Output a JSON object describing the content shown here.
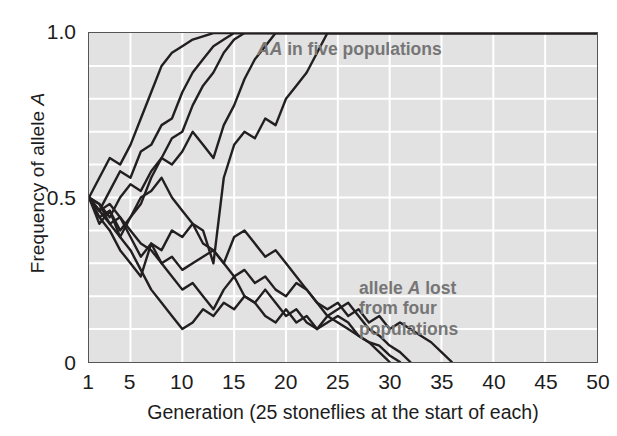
{
  "chart_data": {
    "type": "line",
    "title": "",
    "xlabel": "Generation (25 stoneflies at the start of each)",
    "ylabel": "Frequency of allele A",
    "xlim": [
      1,
      50
    ],
    "ylim": [
      0,
      1.0
    ],
    "xticks": [
      1,
      5,
      10,
      15,
      20,
      25,
      30,
      35,
      40,
      45,
      50
    ],
    "xticklabels": [
      "1",
      "5",
      "10",
      "15",
      "20",
      "25",
      "30",
      "35",
      "40",
      "45",
      "50"
    ],
    "yticks": [
      0,
      0.5,
      1.0
    ],
    "yticklabels": [
      "0",
      "0.5",
      "1.0"
    ],
    "grid": "both, white lines; vertical every 5 generations, horizontal every 0.1",
    "legend_position": "none (in-plot text annotations)",
    "plot_background": "#e2e2e2",
    "line_color": "#231f20",
    "annotation_color": "#767676",
    "annotations": [
      {
        "id": "fixed",
        "text": "AA in five populations",
        "italic_part": "AA",
        "rest": " in five populations",
        "x": 22,
        "y": 0.97
      },
      {
        "id": "lost",
        "text": "allele A lost\nfrom four\npopulations",
        "line1_pre": "allele ",
        "line1_italic": "A",
        "line1_post": " lost",
        "line2": "from four",
        "line3": "populations",
        "x": 36,
        "y": 0.25
      }
    ],
    "series": [
      {
        "name": "population 1 (A fixed)",
        "outcome": "fixed",
        "x": [
          1,
          2,
          3,
          4,
          5,
          6,
          7,
          8,
          9,
          10,
          11,
          12,
          13,
          50
        ],
        "values": [
          0.5,
          0.56,
          0.62,
          0.6,
          0.66,
          0.74,
          0.82,
          0.9,
          0.94,
          0.96,
          0.98,
          0.99,
          1.0,
          1.0
        ]
      },
      {
        "name": "population 2 (A fixed)",
        "outcome": "fixed",
        "x": [
          1,
          2,
          3,
          4,
          5,
          6,
          7,
          8,
          9,
          10,
          11,
          12,
          13,
          14,
          15,
          50
        ],
        "values": [
          0.5,
          0.46,
          0.52,
          0.58,
          0.56,
          0.64,
          0.66,
          0.72,
          0.74,
          0.82,
          0.88,
          0.92,
          0.96,
          0.98,
          1.0,
          1.0
        ]
      },
      {
        "name": "population 3 (A fixed)",
        "outcome": "fixed",
        "x": [
          1,
          2,
          3,
          4,
          5,
          6,
          7,
          8,
          9,
          10,
          11,
          12,
          13,
          14,
          15,
          16,
          50
        ],
        "values": [
          0.5,
          0.48,
          0.44,
          0.5,
          0.54,
          0.52,
          0.58,
          0.62,
          0.68,
          0.7,
          0.78,
          0.84,
          0.88,
          0.94,
          0.98,
          1.0,
          1.0
        ]
      },
      {
        "name": "population 4 (A fixed)",
        "outcome": "fixed",
        "x": [
          1,
          2,
          3,
          4,
          5,
          6,
          7,
          8,
          9,
          10,
          11,
          12,
          13,
          14,
          15,
          16,
          17,
          18,
          19,
          50
        ],
        "values": [
          0.5,
          0.44,
          0.46,
          0.4,
          0.44,
          0.48,
          0.56,
          0.62,
          0.6,
          0.64,
          0.7,
          0.66,
          0.62,
          0.72,
          0.78,
          0.86,
          0.92,
          0.96,
          1.0,
          1.0
        ]
      },
      {
        "name": "population 5 (A fixed)",
        "outcome": "fixed",
        "x": [
          1,
          2,
          3,
          4,
          5,
          6,
          7,
          8,
          9,
          10,
          11,
          12,
          13,
          14,
          15,
          16,
          17,
          18,
          19,
          20,
          21,
          22,
          23,
          24,
          50
        ],
        "values": [
          0.5,
          0.46,
          0.42,
          0.38,
          0.44,
          0.5,
          0.52,
          0.56,
          0.5,
          0.46,
          0.42,
          0.4,
          0.3,
          0.56,
          0.66,
          0.7,
          0.68,
          0.74,
          0.72,
          0.8,
          0.84,
          0.88,
          0.94,
          1.0,
          1.0
        ]
      },
      {
        "name": "population 6 (A lost)",
        "outcome": "lost",
        "x": [
          1,
          2,
          3,
          4,
          5,
          6,
          7,
          8,
          9,
          10,
          11,
          12,
          13,
          14,
          15,
          16,
          17,
          18,
          19,
          20,
          21,
          22,
          23,
          24,
          25,
          26,
          27,
          28,
          29,
          30
        ],
        "values": [
          0.5,
          0.44,
          0.4,
          0.34,
          0.3,
          0.26,
          0.36,
          0.3,
          0.26,
          0.22,
          0.24,
          0.2,
          0.16,
          0.22,
          0.26,
          0.2,
          0.18,
          0.22,
          0.18,
          0.14,
          0.16,
          0.12,
          0.1,
          0.14,
          0.12,
          0.1,
          0.08,
          0.06,
          0.03,
          0.0
        ]
      },
      {
        "name": "population 7 (A lost)",
        "outcome": "lost",
        "x": [
          1,
          2,
          3,
          4,
          5,
          6,
          7,
          8,
          9,
          10,
          11,
          12,
          13,
          14,
          15,
          16,
          17,
          18,
          19,
          20,
          21,
          22,
          23,
          24,
          25,
          26,
          27,
          28,
          29,
          30,
          31
        ],
        "values": [
          0.5,
          0.42,
          0.46,
          0.38,
          0.34,
          0.28,
          0.22,
          0.18,
          0.14,
          0.1,
          0.12,
          0.16,
          0.14,
          0.18,
          0.16,
          0.2,
          0.18,
          0.14,
          0.12,
          0.16,
          0.12,
          0.14,
          0.1,
          0.12,
          0.14,
          0.12,
          0.08,
          0.06,
          0.05,
          0.02,
          0.0
        ]
      },
      {
        "name": "population 8 (A lost)",
        "outcome": "lost",
        "x": [
          1,
          2,
          3,
          4,
          5,
          6,
          7,
          8,
          9,
          10,
          11,
          12,
          13,
          14,
          15,
          16,
          17,
          18,
          19,
          20,
          21,
          22,
          23,
          24,
          25,
          26,
          27,
          28,
          29,
          30,
          31,
          32
        ],
        "values": [
          0.5,
          0.48,
          0.42,
          0.44,
          0.38,
          0.32,
          0.36,
          0.34,
          0.4,
          0.38,
          0.42,
          0.36,
          0.34,
          0.3,
          0.38,
          0.4,
          0.36,
          0.32,
          0.34,
          0.3,
          0.26,
          0.22,
          0.18,
          0.14,
          0.16,
          0.18,
          0.14,
          0.1,
          0.08,
          0.05,
          0.03,
          0.0
        ]
      },
      {
        "name": "population 9 (A lost)",
        "outcome": "lost",
        "x": [
          1,
          2,
          3,
          4,
          5,
          6,
          7,
          8,
          9,
          10,
          11,
          12,
          13,
          14,
          15,
          16,
          17,
          18,
          19,
          20,
          21,
          22,
          23,
          24,
          25,
          26,
          27,
          28,
          29,
          30,
          31,
          32,
          33,
          34,
          35,
          36
        ],
        "values": [
          0.5,
          0.46,
          0.48,
          0.44,
          0.4,
          0.36,
          0.34,
          0.3,
          0.32,
          0.28,
          0.3,
          0.32,
          0.34,
          0.3,
          0.26,
          0.28,
          0.24,
          0.26,
          0.22,
          0.2,
          0.24,
          0.22,
          0.18,
          0.16,
          0.18,
          0.14,
          0.16,
          0.12,
          0.14,
          0.1,
          0.12,
          0.1,
          0.08,
          0.06,
          0.03,
          0.0
        ]
      }
    ]
  }
}
